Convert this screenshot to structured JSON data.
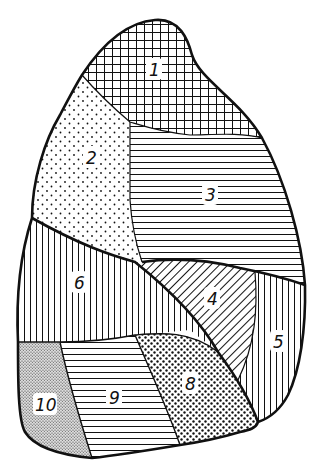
{
  "diagram": {
    "type": "segment-map",
    "outline_color": "#111111",
    "background": "#ffffff",
    "segments": [
      {
        "id": 1,
        "label": "1",
        "pattern": "crosshatch-grid",
        "position": "apex"
      },
      {
        "id": 2,
        "label": "2",
        "pattern": "sparse-dots",
        "position": "upper-left"
      },
      {
        "id": 3,
        "label": "3",
        "pattern": "horizontal-lines",
        "position": "upper-right"
      },
      {
        "id": 4,
        "label": "4",
        "pattern": "diagonal-lines",
        "position": "middle-center"
      },
      {
        "id": 5,
        "label": "5",
        "pattern": "vertical-lines",
        "position": "middle-right"
      },
      {
        "id": 6,
        "label": "6",
        "pattern": "vertical-lines",
        "position": "middle-left"
      },
      {
        "id": 8,
        "label": "8",
        "pattern": "dense-dots",
        "position": "lower-center-right"
      },
      {
        "id": 9,
        "label": "9",
        "pattern": "horizontal-lines",
        "position": "lower-center"
      },
      {
        "id": 10,
        "label": "10",
        "pattern": "fine-stipple",
        "position": "lower-left"
      }
    ]
  }
}
